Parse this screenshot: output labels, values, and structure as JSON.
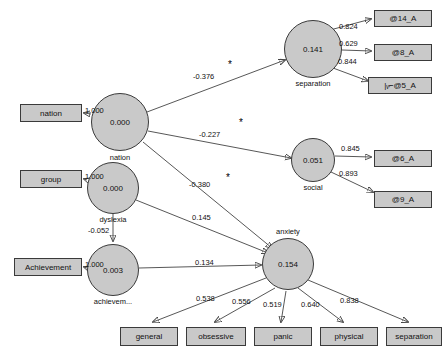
{
  "diagram": {
    "type": "sem-path-diagram",
    "latent_factors": [
      {
        "id": "nation_f",
        "value": "0.000",
        "label": "nation",
        "cx": 120,
        "cy": 122,
        "r": 29
      },
      {
        "id": "dyslexia_f",
        "value": "0.000",
        "label": "dyslexia",
        "cx": 113,
        "cy": 188,
        "r": 26
      },
      {
        "id": "achievement_f",
        "value": "0.003",
        "label": "achievem...",
        "cx": 113,
        "cy": 270,
        "r": 26
      },
      {
        "id": "separation_f",
        "value": "0.141",
        "label": "separation",
        "cx": 313,
        "cy": 49,
        "r": 29
      },
      {
        "id": "social_f",
        "value": "0.051",
        "label": "social",
        "cx": 313,
        "cy": 160,
        "r": 22
      },
      {
        "id": "anxiety_f",
        "value": "0.154",
        "label": "anxiety",
        "cx": 288,
        "cy": 264,
        "r": 26
      }
    ],
    "observed_boxes": [
      {
        "id": "nation_obs",
        "label": "nation",
        "x": 20,
        "y": 104,
        "w": 62,
        "h": 18
      },
      {
        "id": "group_obs",
        "label": "group",
        "x": 20,
        "y": 170,
        "w": 62,
        "h": 18
      },
      {
        "id": "achievement_obs",
        "label": "Achievement",
        "x": 14,
        "y": 258,
        "w": 68,
        "h": 18
      },
      {
        "id": "a14",
        "label": "@14_A",
        "x": 374,
        "y": 10,
        "w": 58,
        "h": 17
      },
      {
        "id": "a8",
        "label": "@8_A",
        "x": 374,
        "y": 44,
        "w": 58,
        "h": 17
      },
      {
        "id": "a5",
        "label": "|ᵥ⌐@5_A",
        "x": 368,
        "y": 77,
        "w": 64,
        "h": 17
      },
      {
        "id": "a6",
        "label": "@6_A",
        "x": 374,
        "y": 150,
        "w": 58,
        "h": 17
      },
      {
        "id": "a9",
        "label": "@9_A",
        "x": 374,
        "y": 191,
        "w": 58,
        "h": 17
      },
      {
        "id": "general",
        "label": "general",
        "x": 120,
        "y": 327,
        "w": 58,
        "h": 19
      },
      {
        "id": "obsessive",
        "label": "obsessive",
        "x": 186,
        "y": 327,
        "w": 60,
        "h": 19
      },
      {
        "id": "panic",
        "label": "panic",
        "x": 254,
        "y": 327,
        "w": 58,
        "h": 19
      },
      {
        "id": "physical",
        "label": "physical",
        "x": 320,
        "y": 327,
        "w": 58,
        "h": 19
      },
      {
        "id": "separation_obs",
        "label": "separation",
        "x": 386,
        "y": 327,
        "w": 56,
        "h": 19
      }
    ],
    "path_coefficients": [
      {
        "id": "nation_to_nationobs",
        "value": "1.000",
        "x": 85,
        "y": 106,
        "significant": false
      },
      {
        "id": "nation_to_separation",
        "value": "-0.376",
        "x": 193,
        "y": 72,
        "significant": true,
        "star_x": 228,
        "star_y": 60
      },
      {
        "id": "nation_to_social",
        "value": "-0.227",
        "x": 199,
        "y": 130,
        "significant": true,
        "star_x": 239,
        "star_y": 118
      },
      {
        "id": "nation_to_anxiety",
        "value": "-0.380",
        "x": 189,
        "y": 180,
        "significant": true,
        "star_x": 226,
        "star_y": 173
      },
      {
        "id": "dyslexia_to_group",
        "value": "1.000",
        "x": 85,
        "y": 172,
        "significant": false
      },
      {
        "id": "dyslexia_to_achievement",
        "value": "-0.052",
        "x": 88,
        "y": 226,
        "significant": false
      },
      {
        "id": "dyslexia_to_anxiety",
        "value": "0.145",
        "x": 192,
        "y": 213,
        "significant": false
      },
      {
        "id": "achievement_to_achievementobs",
        "value": "1.000",
        "x": 85,
        "y": 260,
        "significant": false
      },
      {
        "id": "achievement_to_anxiety",
        "value": "0.134",
        "x": 195,
        "y": 258,
        "significant": false
      },
      {
        "id": "separation_to_a14",
        "value": "0.824",
        "x": 339,
        "y": 28,
        "significant": false
      },
      {
        "id": "separation_to_a8",
        "value": "0.629",
        "x": 339,
        "y": 45,
        "significant": false
      },
      {
        "id": "separation_to_a5",
        "value": "0.844",
        "x": 338,
        "y": 62,
        "significant": false
      },
      {
        "id": "social_to_a6",
        "value": "0.845",
        "x": 344,
        "y": 150,
        "significant": false
      },
      {
        "id": "social_to_a9",
        "value": "0.893",
        "x": 342,
        "y": 175,
        "significant": false
      },
      {
        "id": "anxiety_to_general",
        "value": "0.538",
        "x": 196,
        "y": 294,
        "significant": false
      },
      {
        "id": "anxiety_to_obsessive",
        "value": "0.556",
        "x": 232,
        "y": 297,
        "significant": false
      },
      {
        "id": "anxiety_to_panic",
        "value": "0.519",
        "x": 263,
        "y": 300,
        "significant": false
      },
      {
        "id": "anxiety_to_physical",
        "value": "0.640",
        "x": 301,
        "y": 300,
        "significant": false
      },
      {
        "id": "anxiety_to_separation",
        "value": "0.838",
        "x": 340,
        "y": 296,
        "significant": false
      }
    ],
    "significance_marker": "*"
  }
}
